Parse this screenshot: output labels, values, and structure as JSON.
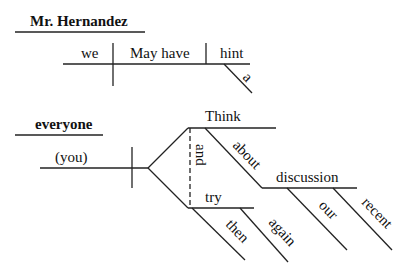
{
  "diagram": {
    "type": "sentence-diagram",
    "sentence1": {
      "address": "Mr. Hernandez",
      "subject": "we",
      "verb": "May have",
      "object": "hint",
      "modifiers": {
        "hint": [
          "a"
        ]
      }
    },
    "sentence2": {
      "address": "everyone",
      "subject": "(you)",
      "conjunction": "and",
      "verbs": [
        {
          "verb": "Think",
          "modifiers": [
            {
              "preposition": "about",
              "object": "discussion",
              "object_modifiers": [
                "our",
                "recent"
              ]
            }
          ]
        },
        {
          "verb": "try",
          "modifiers": [
            "then",
            "again"
          ]
        }
      ]
    }
  }
}
